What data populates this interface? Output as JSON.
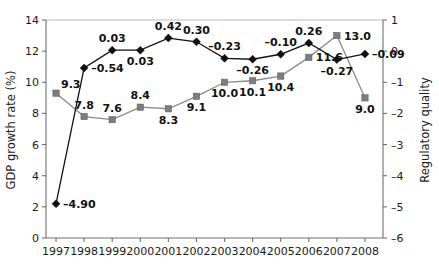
{
  "chart_data": {
    "type": "line",
    "title": "",
    "xlabel": "",
    "categories": [
      "1997",
      "1998",
      "1999",
      "2000",
      "2001",
      "2002",
      "2003",
      "2004",
      "2005",
      "2006",
      "2007",
      "2008"
    ],
    "grid": false,
    "legend": "none",
    "axes": {
      "left": {
        "label": "GDP growth rate (%)",
        "min": 0,
        "max": 14,
        "ticks": [
          "0",
          "2",
          "4",
          "6",
          "8",
          "10",
          "12",
          "14"
        ],
        "tick_values": [
          0,
          2,
          4,
          6,
          8,
          10,
          12,
          14
        ]
      },
      "right": {
        "label": "Regulatory quality",
        "min": -6,
        "max": 1,
        "ticks": [
          "–6",
          "–5",
          "–4",
          "–3",
          "–2",
          "–1",
          "0",
          "1"
        ],
        "tick_values": [
          -6,
          -5,
          -4,
          -3,
          -2,
          -1,
          0,
          1
        ]
      }
    },
    "series": [
      {
        "name": "GDP growth rate (%)",
        "axis": "left",
        "marker": "square",
        "color": "#7d7d7d",
        "values": [
          9.3,
          7.8,
          7.6,
          8.4,
          8.3,
          9.1,
          10.0,
          10.1,
          10.4,
          11.6,
          13.0,
          9.0
        ],
        "labels": [
          "9.3",
          "7.8",
          "7.6",
          "8.4",
          "8.3",
          "9.1",
          "10.0",
          "10.1",
          "10.4",
          "11.6",
          "13.0",
          "9.0"
        ],
        "label_positions": [
          "above-right",
          "above",
          "above",
          "above",
          "below",
          "below",
          "below",
          "below",
          "below",
          "right",
          "right",
          "below"
        ]
      },
      {
        "name": "Regulatory quality",
        "axis": "right",
        "marker": "diamond",
        "color": "#111111",
        "values": [
          -4.9,
          -0.54,
          0.03,
          0.03,
          0.42,
          0.3,
          -0.23,
          -0.26,
          -0.1,
          0.26,
          -0.27,
          -0.09
        ],
        "labels": [
          "–4.90",
          "–0.54",
          "0.03",
          "0.03",
          "0.42",
          "0.30",
          "–0.23",
          "–0.26",
          "–0.10",
          "0.26",
          "–0.27",
          "–0.09"
        ],
        "label_positions": [
          "right",
          "right",
          "above",
          "below",
          "above",
          "above",
          "above",
          "below",
          "above",
          "above",
          "below",
          "right"
        ]
      }
    ]
  }
}
